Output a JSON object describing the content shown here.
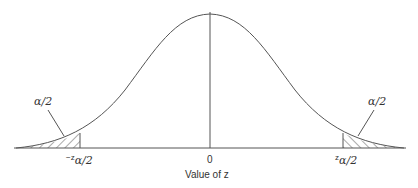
{
  "diagram": {
    "type": "normal-distribution-two-tailed",
    "x_axis_label": "Value of z",
    "center_tick_label": "0",
    "left_critical_prefix": "−z",
    "left_critical_sub": "α/2",
    "right_critical_prefix": "z",
    "right_critical_sub": "α/2",
    "left_tail_label": "α/2",
    "right_tail_label": "α/2"
  },
  "colors": {
    "line": "#555555",
    "text": "#333333",
    "background": "#ffffff"
  }
}
